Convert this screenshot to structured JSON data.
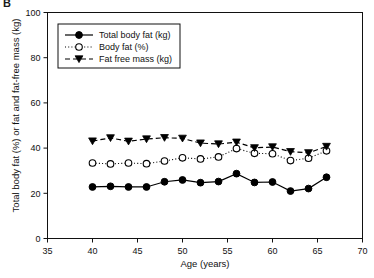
{
  "panel": {
    "label": "B"
  },
  "chart_data": {
    "type": "line",
    "title": "",
    "xlabel": "Age (years)",
    "ylabel": "Total body fat (%) or fat and fat-free mass (kg)",
    "xlim": [
      35,
      70
    ],
    "ylim": [
      0,
      100
    ],
    "xticks": [
      35,
      40,
      45,
      50,
      55,
      60,
      65,
      70
    ],
    "yticks": [
      0,
      20,
      40,
      60,
      80,
      100
    ],
    "grid": false,
    "legend_position": "top-left",
    "x": [
      40,
      42,
      44,
      46,
      48,
      50,
      52,
      54,
      56,
      58,
      60,
      62,
      64,
      66
    ],
    "series": [
      {
        "name": "Total body fat (kg)",
        "marker": "filled-circle",
        "line": "solid",
        "color": "#000000",
        "values": [
          22.8,
          23.1,
          22.8,
          22.8,
          25.1,
          25.9,
          24.7,
          25.2,
          28.7,
          24.8,
          25.0,
          21.0,
          22.1,
          27.1
        ]
      },
      {
        "name": "Body fat (%)",
        "marker": "open-circle",
        "line": "dotted",
        "color": "#000000",
        "values": [
          33.4,
          33.0,
          33.4,
          33.1,
          34.3,
          35.7,
          35.2,
          36.1,
          39.8,
          37.7,
          37.5,
          34.5,
          35.5,
          38.8
        ]
      },
      {
        "name": "Fat free mass (kg)",
        "marker": "filled-triangle-down",
        "line": "dashed",
        "color": "#000000",
        "values": [
          43.1,
          44.5,
          43.0,
          44.0,
          44.6,
          44.3,
          42.2,
          41.8,
          42.6,
          40.1,
          40.5,
          38.4,
          37.9,
          40.7
        ]
      }
    ]
  },
  "legend": {
    "items": [
      {
        "label": "Total body fat (kg)"
      },
      {
        "label": "Body fat (%)"
      },
      {
        "label": "Fat free mass (kg)"
      }
    ]
  }
}
